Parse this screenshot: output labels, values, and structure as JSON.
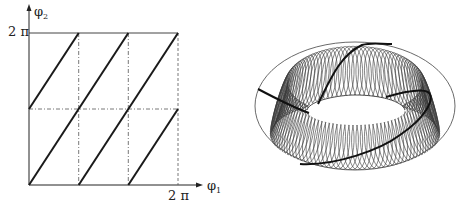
{
  "left_diagram": {
    "title": "Torus flow on square (phase diagram)",
    "y_axis": {
      "symbol": "φ",
      "subscript": "2",
      "tick_label": "2 π"
    },
    "x_axis": {
      "symbol": "φ",
      "subscript": "1",
      "tick_label": "2 π"
    },
    "line_color": "#1a1a1a",
    "grid_dashed_color": "#555555"
  },
  "right_diagram": {
    "title": "Torus with winding trajectory",
    "wire_color": "#333333",
    "trajectory_color": "#111111"
  }
}
